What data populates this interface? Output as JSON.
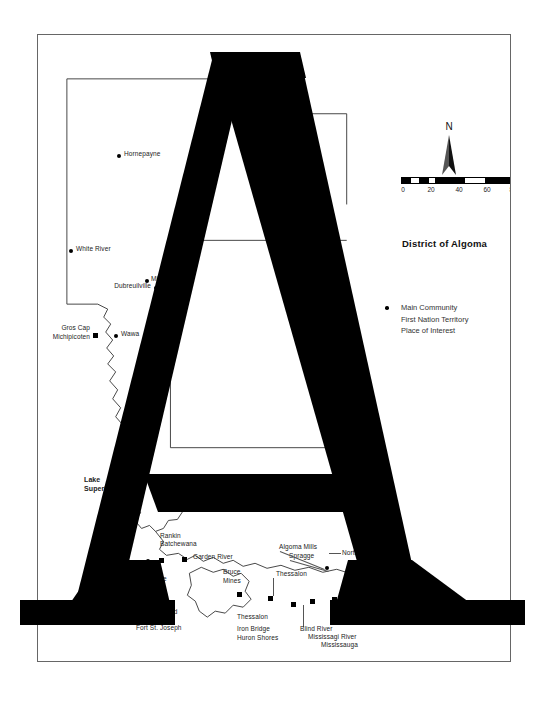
{
  "document": {
    "type": "scanned-map-page",
    "background_color": "#ffffff",
    "frame_color": "#666666"
  },
  "overlay": {
    "glyph": "A",
    "color": "#000000",
    "description": "large-black-letter-a"
  },
  "map": {
    "title": "District of Algoma",
    "water_label": "Lake\nSuperior",
    "north_arrow": {
      "label": "N"
    },
    "scale_bar": {
      "units": "Km",
      "ticks": [
        "0",
        "20",
        "40",
        "60",
        "80"
      ],
      "min": 0,
      "max": 80
    },
    "legend": [
      {
        "label": "Main Community",
        "symbol": "filled-circle"
      },
      {
        "label": "First Nation Territory",
        "symbol": "none"
      },
      {
        "label": "Place of Interest",
        "symbol": "none"
      }
    ],
    "places": [
      {
        "name": "Hornepayne",
        "symbol": "dot"
      },
      {
        "name": "White River",
        "symbol": "dot"
      },
      {
        "name": "Dubreuilville",
        "symbol": "dot"
      },
      {
        "name": "Missanabie",
        "symbol": "dot"
      },
      {
        "name": "Gros Cap\nMichipicoten",
        "symbol": "square"
      },
      {
        "name": "Wawa",
        "symbol": "dot"
      },
      {
        "name": "Rankin",
        "symbol": "square"
      },
      {
        "name": "Batchewana",
        "symbol": "square"
      },
      {
        "name": "Garden River",
        "symbol": "square"
      },
      {
        "name": "Ste. Marie",
        "symbol": "none"
      },
      {
        "name": "Bruce\nMines",
        "symbol": "square"
      },
      {
        "name": "Thessalon",
        "symbol": "square"
      },
      {
        "name": "Thessalon",
        "symbol": "square"
      },
      {
        "name": "Iron Bridge\nHuron Shores",
        "symbol": "square"
      },
      {
        "name": "Mississagi River",
        "symbol": "square"
      },
      {
        "name": "Mississauga",
        "symbol": "square"
      },
      {
        "name": "Blind River",
        "symbol": "square"
      },
      {
        "name": "Serpent River",
        "symbol": "square"
      },
      {
        "name": "Algoma Mills",
        "symbol": "square"
      },
      {
        "name": "Spragge",
        "symbol": "square"
      },
      {
        "name": "North",
        "symbol": "square"
      },
      {
        "name": "St. Joseph Island",
        "symbol": "none"
      },
      {
        "name": "Fort St. Joseph",
        "symbol": "none"
      }
    ]
  }
}
